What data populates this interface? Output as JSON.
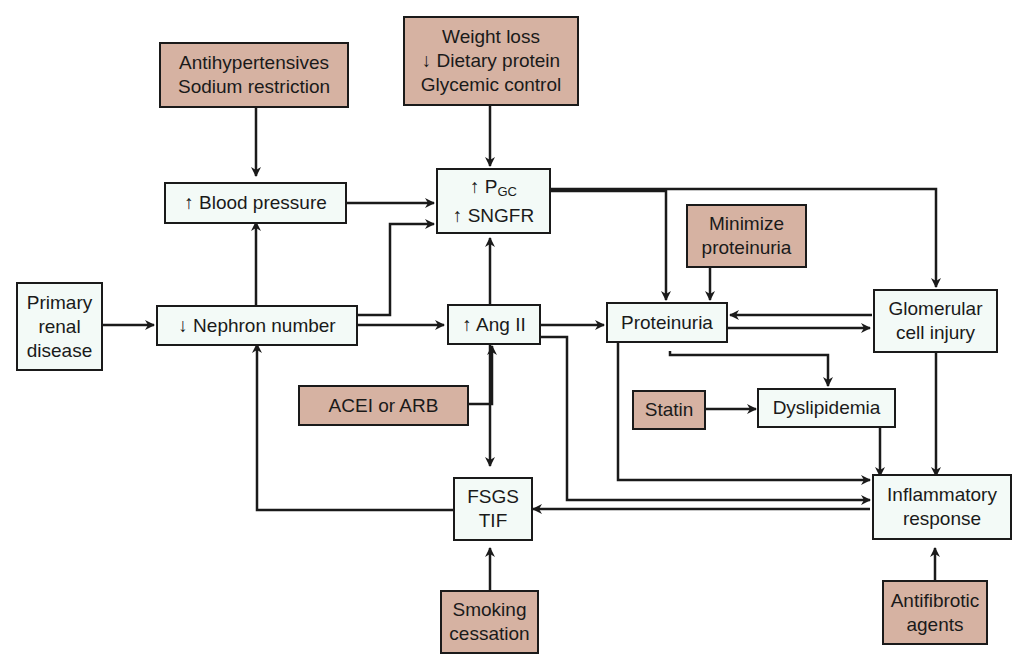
{
  "diagram": {
    "nodes": {
      "primary": {
        "lines": [
          "Primary",
          "renal",
          "disease"
        ]
      },
      "nephron": {
        "lines": [
          "↓ Nephron number"
        ]
      },
      "bp": {
        "lines": [
          "↑ Blood pressure"
        ]
      },
      "pgc": {
        "line1_arrow": "↑ P",
        "line1_sub": "GC",
        "line2": "↑ SNGFR"
      },
      "ang": {
        "lines": [
          "↑ Ang II"
        ]
      },
      "proteinuria": {
        "lines": [
          "Proteinuria"
        ]
      },
      "glom": {
        "lines": [
          "Glomerular",
          "cell injury"
        ]
      },
      "dyslip": {
        "lines": [
          "Dyslipidemia"
        ]
      },
      "inflam": {
        "lines": [
          "Inflammatory",
          "response"
        ]
      },
      "fsgs": {
        "lines": [
          "FSGS",
          "TIF"
        ]
      }
    },
    "interventions": {
      "antihyp": {
        "lines": [
          "Antihypertensives",
          "Sodium restriction"
        ]
      },
      "weight": {
        "lines": [
          "Weight loss",
          "↓ Dietary protein",
          "Glycemic control"
        ]
      },
      "minprot": {
        "lines": [
          "Minimize",
          "proteinuria"
        ]
      },
      "acei": {
        "lines": [
          "ACEI or ARB"
        ]
      },
      "statin": {
        "lines": [
          "Statin"
        ]
      },
      "smoking": {
        "lines": [
          "Smoking",
          "cessation"
        ]
      },
      "antifib": {
        "lines": [
          "Antifibrotic",
          "agents"
        ]
      }
    },
    "colors": {
      "state_fill": "#f3faf7",
      "intervention_fill": "#d6b2a2",
      "stroke": "#1a1a1a"
    }
  }
}
